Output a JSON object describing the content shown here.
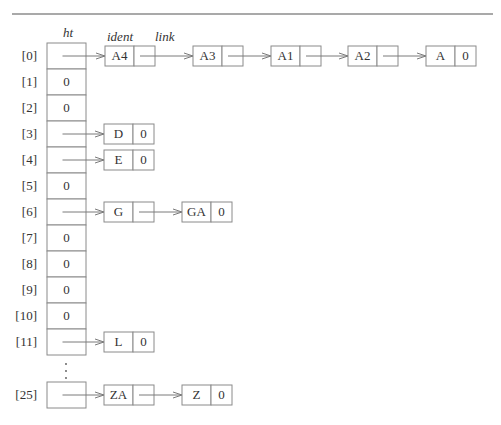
{
  "figure": {
    "headers": {
      "table": "ht",
      "ident": "ident",
      "link": "link"
    },
    "null_value": "0",
    "ellipsis": "⋮",
    "table_rows": [
      {
        "index": "[0]",
        "value": null,
        "chain": [
          "A4",
          "A3",
          "A1",
          "A2",
          "A"
        ]
      },
      {
        "index": "[1]",
        "value": "0",
        "chain": []
      },
      {
        "index": "[2]",
        "value": "0",
        "chain": []
      },
      {
        "index": "[3]",
        "value": null,
        "chain": [
          "D"
        ]
      },
      {
        "index": "[4]",
        "value": null,
        "chain": [
          "E"
        ]
      },
      {
        "index": "[5]",
        "value": "0",
        "chain": []
      },
      {
        "index": "[6]",
        "value": null,
        "chain": [
          "G",
          "GA"
        ]
      },
      {
        "index": "[7]",
        "value": "0",
        "chain": []
      },
      {
        "index": "[8]",
        "value": "0",
        "chain": []
      },
      {
        "index": "[9]",
        "value": "0",
        "chain": []
      },
      {
        "index": "[10]",
        "value": "0",
        "chain": []
      },
      {
        "index": "[11]",
        "value": null,
        "chain": [
          "L"
        ]
      },
      {
        "index": "[25]",
        "value": null,
        "chain": [
          "ZA",
          "Z"
        ]
      }
    ],
    "colors": {
      "line": "#7a7a7a",
      "box_border": "#8a8a8a",
      "text": "#333333",
      "background": "#ffffff"
    }
  }
}
